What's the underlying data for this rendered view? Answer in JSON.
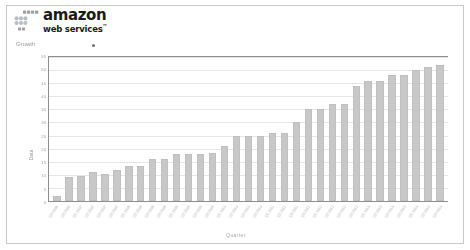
{
  "brand": {
    "name": "amazon",
    "tagline": "web services",
    "trademark": "™",
    "logo_icon": "aws-cube-grid-icon"
  },
  "chart_title": "Growth",
  "chart_data": {
    "type": "bar",
    "title": "Growth",
    "xlabel": "Quarter",
    "ylabel": "Data",
    "ylim": [
      0,
      55
    ],
    "yticks": [
      0,
      5,
      10,
      15,
      20,
      25,
      30,
      35,
      40,
      45,
      50,
      55
    ],
    "grid": true,
    "legend_position": "top",
    "bar_color": "#c8c8c8",
    "categories": [
      "Q3 2006",
      "Q4 2006",
      "Q1 2007",
      "Q2 2007",
      "Q3 2007",
      "Q4 2007",
      "Q1 2008",
      "Q2 2008",
      "Q3 2008",
      "Q4 2008",
      "Q1 2009",
      "Q2 2009",
      "Q3 2009",
      "Q4 2009",
      "Q1 2010",
      "Q2 2010",
      "Q3 2010",
      "Q4 2010",
      "Q1 2011",
      "Q2 2011",
      "Q3 2011",
      "Q4 2011",
      "Q1 2012",
      "Q2 2012",
      "Q3 2012",
      "Q4 2012",
      "Q1 2013",
      "Q2 2013",
      "Q3 2013",
      "Q4 2013",
      "Q1 2014",
      "Q2 2014",
      "Q3 2014"
    ],
    "values": [
      2,
      9,
      9.5,
      11,
      10.5,
      12,
      13.5,
      13.5,
      16,
      16,
      18,
      18,
      18,
      18.5,
      21,
      25,
      25,
      25,
      26,
      26,
      30,
      35,
      35,
      37,
      37,
      44,
      46,
      46,
      48,
      48,
      50,
      51,
      52
    ]
  }
}
